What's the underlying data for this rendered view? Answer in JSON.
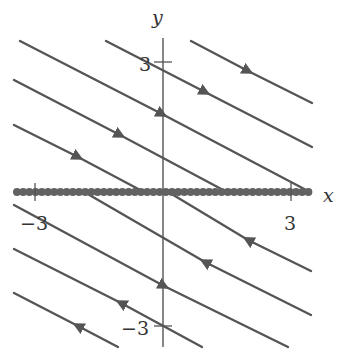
{
  "figure": {
    "type": "phase-portrait",
    "axes": {
      "x_label": "x",
      "y_label": "y",
      "x_ticks": [
        {
          "value": -3,
          "label": "−3"
        },
        {
          "value": 3,
          "label": "3"
        }
      ],
      "y_ticks": [
        {
          "value": 3,
          "label": "3"
        },
        {
          "value": -3,
          "label": "−3"
        }
      ]
    },
    "colors": {
      "trajectory": "#555555",
      "axis": "#555555",
      "equilibrium": "#606060",
      "text": "#333333"
    },
    "equilibrium_line": {
      "description": "line of equilibrium points along the x-axis (y = 0)",
      "x_range": [
        -3.4,
        3.5
      ]
    },
    "trajectories": [
      {
        "id": "A",
        "side": "upper",
        "direction": "toward x-axis (down-right)"
      },
      {
        "id": "B",
        "side": "upper",
        "direction": "toward x-axis (down-right)"
      },
      {
        "id": "C",
        "side": "upper",
        "direction": "toward x-axis (down-right)"
      },
      {
        "id": "D",
        "side": "upper",
        "direction": "toward x-axis (down-right)"
      },
      {
        "id": "E",
        "side": "upper",
        "direction": "toward x-axis (down-right)"
      },
      {
        "id": "F",
        "side": "lower",
        "direction": "toward x-axis (up-left)"
      },
      {
        "id": "G",
        "side": "lower",
        "direction": "toward x-axis (up-left)"
      },
      {
        "id": "H",
        "side": "lower",
        "direction": "down along slope at y-axis crossing"
      },
      {
        "id": "I",
        "side": "lower",
        "direction": "toward x-axis (up-left)"
      },
      {
        "id": "J",
        "side": "lower",
        "direction": "toward x-axis (up-left)"
      }
    ]
  }
}
